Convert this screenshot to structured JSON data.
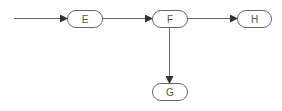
{
  "diagram": {
    "type": "flowchart",
    "colors": {
      "stroke": "#666666",
      "node_fill": "#ffffff",
      "text": "#555555",
      "background": "#ffffff"
    },
    "nodes": [
      {
        "id": "E",
        "label": "E",
        "x": 67,
        "y": 10,
        "w": 35,
        "h": 17
      },
      {
        "id": "F",
        "label": "F",
        "x": 152,
        "y": 10,
        "w": 35,
        "h": 17
      },
      {
        "id": "H",
        "label": "H",
        "x": 237,
        "y": 10,
        "w": 34,
        "h": 17
      },
      {
        "id": "G",
        "label": "G",
        "x": 152,
        "y": 83,
        "w": 35,
        "h": 17
      }
    ],
    "edges": [
      {
        "from": "start",
        "to": "E"
      },
      {
        "from": "E",
        "to": "F"
      },
      {
        "from": "F",
        "to": "H"
      },
      {
        "from": "F",
        "to": "G"
      }
    ]
  }
}
